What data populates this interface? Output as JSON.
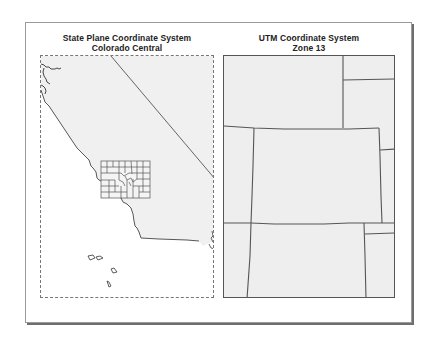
{
  "layout": {
    "frame_label": "Map layout comparison"
  },
  "panels": [
    {
      "title_line1": "State Plane Coordinate System",
      "title_line2": "Colorado Central",
      "map_content": "California coastline, Nevada border, Colorado counties outline",
      "land_color": "#f0f0f0",
      "water_color": "#ffffff",
      "border_style": "dashed"
    },
    {
      "title_line1": "UTM Coordinate System",
      "title_line2": "Zone 13",
      "map_content": "Colorado and surrounding state boundaries (Wyoming, Nebraska, Kansas, Oklahoma, New Mexico, Utah)",
      "land_color": "#eeeeee",
      "border_style": "solid"
    }
  ],
  "colors": {
    "boundary_line": "#555555",
    "frame_shadow": "#6e6e6e",
    "title_text": "#222222"
  }
}
